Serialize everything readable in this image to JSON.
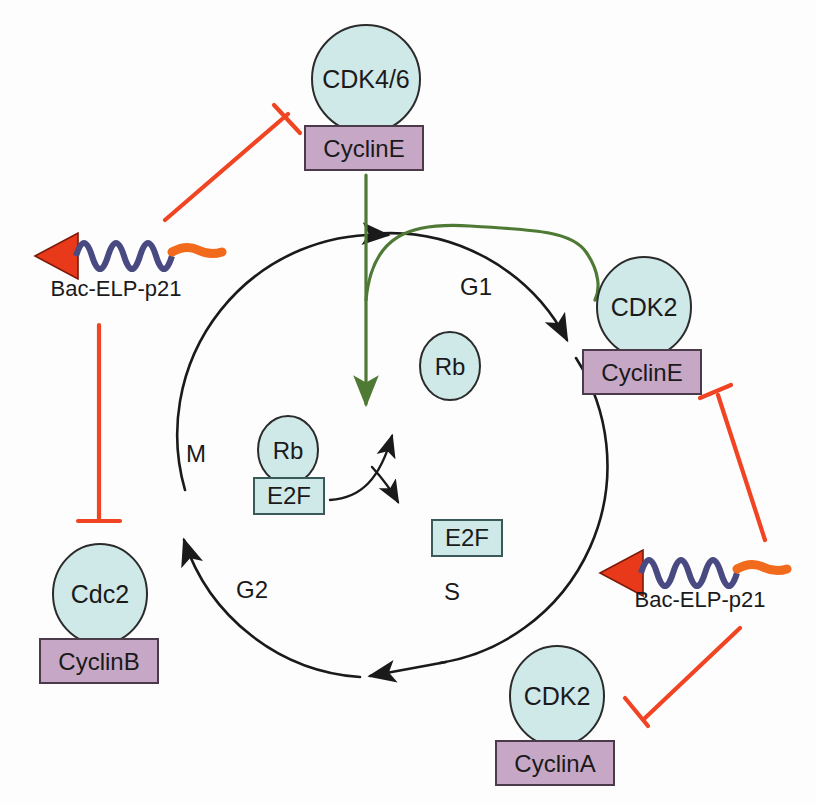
{
  "figure": {
    "background_color": "#fdfdfd"
  },
  "colors": {
    "kinase_fill": "#cfe8e8",
    "kinase_stroke": "#2b2b2b",
    "cyclin_fill": "#c6a8c6",
    "cyclin_stroke": "#4a3a4a",
    "factor_fill": "#cfe8e8",
    "factor_stroke": "#3a5a5a",
    "inhibitor_red": "#f04423",
    "activation_green": "#4e7a35",
    "cycle_black": "#1a1a1a",
    "elp_blue": "#4a4a82",
    "elp_orange": "#f26a1b",
    "arrowhead_red": "#e8391b"
  },
  "cycle": {
    "phases": [
      {
        "id": "g1",
        "label": "G1",
        "x": 476,
        "y": 295
      },
      {
        "id": "s",
        "label": "S",
        "x": 452,
        "y": 600
      },
      {
        "id": "g2",
        "label": "G2",
        "x": 252,
        "y": 598
      },
      {
        "id": "m",
        "label": "M",
        "x": 196,
        "y": 462
      }
    ]
  },
  "complexes": [
    {
      "id": "cdk46-cycline",
      "kinase": "CDK4/6",
      "cyclin": "CyclinE",
      "kinase_cx": 366,
      "kinase_cy": 79,
      "box_x": 305,
      "box_y": 126,
      "box_w": 118,
      "box_h": 44
    },
    {
      "id": "cdk2-cycline",
      "kinase": "CDK2",
      "cyclin": "CyclinE",
      "kinase_cx": 644,
      "kinase_cy": 307,
      "box_x": 583,
      "box_y": 350,
      "box_w": 118,
      "box_h": 44
    },
    {
      "id": "cdc2-cyclinb",
      "kinase": "Cdc2",
      "cyclin": "CyclinB",
      "kinase_cx": 100,
      "kinase_cy": 594,
      "box_x": 40,
      "box_y": 639,
      "box_w": 118,
      "box_h": 44
    },
    {
      "id": "cdk2-cyclina",
      "kinase": "CDK2",
      "cyclin": "CyclinA",
      "kinase_cx": 557,
      "kinase_cy": 696,
      "box_x": 496,
      "box_y": 741,
      "box_w": 118,
      "box_h": 44
    }
  ],
  "inner_nodes": {
    "rb_bound": {
      "label": "Rb",
      "cx": 288,
      "cy": 450
    },
    "e2f_bound": {
      "label": "E2F",
      "box_x": 254,
      "box_y": 478,
      "box_w": 70,
      "box_h": 36
    },
    "rb_free": {
      "label": "Rb",
      "cx": 450,
      "cy": 366
    },
    "e2f_free": {
      "label": "E2F",
      "box_x": 432,
      "box_y": 520,
      "box_w": 70,
      "box_h": 36
    }
  },
  "constructs": [
    {
      "id": "bac-elp-p21-left",
      "label": "Bac-ELP-p21",
      "label_x": 116,
      "label_y": 296,
      "arrow_x": 40,
      "arrow_y": 256,
      "wave_x": 68,
      "wave_y": 256
    },
    {
      "id": "bac-elp-p21-right",
      "label": "Bac-ELP-p21",
      "label_x": 700,
      "label_y": 607,
      "arrow_x": 602,
      "arrow_y": 573,
      "wave_x": 630,
      "wave_y": 573
    }
  ],
  "interactions": [
    {
      "id": "inhibit-cdk46-cycline",
      "type": "inhibition",
      "from": "bac-elp-p21-left",
      "to": "cdk46-cycline"
    },
    {
      "id": "inhibit-cdc2-cyclinb",
      "type": "inhibition",
      "from": "bac-elp-p21-left",
      "to": "cdc2-cyclinb"
    },
    {
      "id": "inhibit-cdk2-cycline",
      "type": "inhibition",
      "from": "bac-elp-p21-right",
      "to": "cdk2-cycline"
    },
    {
      "id": "inhibit-cdk2-cyclina",
      "type": "inhibition",
      "from": "bac-elp-p21-right",
      "to": "cdk2-cyclina"
    },
    {
      "id": "activate-rb-e2f",
      "type": "activation",
      "from": "cdk46-cycline",
      "to": "rb-e2f-complex"
    },
    {
      "id": "activate-cdk2-cycline",
      "type": "activation",
      "from": "cdk46-cycline",
      "to": "cdk2-cycline"
    }
  ]
}
